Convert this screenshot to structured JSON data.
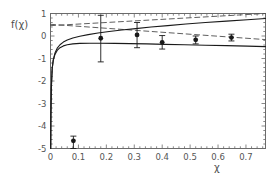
{
  "chart_data": {
    "type": "scatter",
    "title": "",
    "xlabel": "χ",
    "ylabel": "f(χ)",
    "xlim": [
      0.0,
      0.77
    ],
    "ylim": [
      -5,
      1
    ],
    "grid": false,
    "legend": "none",
    "xticks": [
      0,
      0.1,
      0.2,
      0.3,
      0.4,
      0.5,
      0.6,
      0.7
    ],
    "xtick_labels": [
      "0",
      "0.1",
      "0.2",
      "0.3",
      "0.4",
      "0.5",
      "0.6",
      "0.7"
    ],
    "yticks": [
      1,
      0,
      -1,
      -2,
      -3,
      -4,
      -5
    ],
    "ytick_labels": [
      "1",
      "0",
      "-1",
      "-2",
      "-3",
      "-4",
      "-5"
    ],
    "points": {
      "name": "data",
      "marker": "filled-circle",
      "color": "#1a1a1a",
      "x": [
        0.082,
        0.18,
        0.31,
        0.4,
        0.52,
        0.648
      ],
      "y": [
        -4.66,
        -0.1,
        0.05,
        -0.28,
        -0.17,
        -0.07
      ],
      "yerr_low": [
        -5.0,
        -1.15,
        -0.52,
        -0.58,
        -0.35,
        -0.22
      ],
      "yerr_high": [
        -4.45,
        0.92,
        0.6,
        0.02,
        0.0,
        0.08
      ]
    },
    "series": [
      {
        "name": "solid-upper",
        "style": "solid",
        "color": "#1a1a1a",
        "x": [
          0.0008,
          0.0015,
          0.003,
          0.006,
          0.01,
          0.016,
          0.024,
          0.034,
          0.046,
          0.06,
          0.08,
          0.105,
          0.135,
          0.17,
          0.21,
          0.255,
          0.305,
          0.36,
          0.42,
          0.485,
          0.555,
          0.63,
          0.705,
          0.77
        ],
        "y": [
          -5.0,
          -3.55,
          -2.3,
          -1.45,
          -1.05,
          -0.76,
          -0.54,
          -0.39,
          -0.27,
          -0.18,
          -0.09,
          -0.01,
          0.06,
          0.13,
          0.2,
          0.27,
          0.33,
          0.4,
          0.46,
          0.53,
          0.6,
          0.66,
          0.72,
          0.78
        ]
      },
      {
        "name": "solid-lower",
        "style": "solid",
        "color": "#1a1a1a",
        "x": [
          0.0008,
          0.0015,
          0.003,
          0.006,
          0.01,
          0.016,
          0.024,
          0.034,
          0.046,
          0.06,
          0.08,
          0.105,
          0.14,
          0.18,
          0.23,
          0.285,
          0.345,
          0.41,
          0.48,
          0.555,
          0.63,
          0.705,
          0.77
        ],
        "y": [
          -5.0,
          -3.55,
          -2.3,
          -1.45,
          -1.08,
          -0.82,
          -0.64,
          -0.52,
          -0.44,
          -0.39,
          -0.35,
          -0.33,
          -0.32,
          -0.32,
          -0.33,
          -0.34,
          -0.35,
          -0.37,
          -0.39,
          -0.41,
          -0.43,
          -0.45,
          -0.47
        ]
      },
      {
        "name": "dashed-upper",
        "style": "dashed",
        "color": "#4d4d4d",
        "x": [
          0.0,
          0.77
        ],
        "y": [
          0.46,
          1.13
        ]
      },
      {
        "name": "dashed-lower",
        "style": "dashed",
        "color": "#4d4d4d",
        "x": [
          0.0,
          0.77
        ],
        "y": [
          0.52,
          -0.16
        ]
      }
    ]
  }
}
